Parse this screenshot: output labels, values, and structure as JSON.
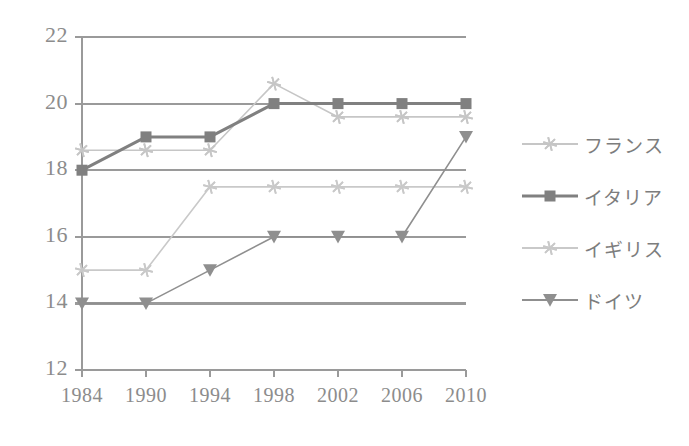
{
  "chart_data": {
    "type": "line",
    "title": "",
    "subtitle": "",
    "xlabel": "",
    "ylabel": "",
    "categories": [
      "1984",
      "1990",
      "1994",
      "1998",
      "2002",
      "2006",
      "2010"
    ],
    "x": [
      1984,
      1990,
      1994,
      1998,
      2002,
      2006,
      2010
    ],
    "ylim": [
      12,
      22
    ],
    "yticks": [
      12,
      14,
      16,
      18,
      20,
      22
    ],
    "grid": "horizontal",
    "legend_position": "right",
    "series": [
      {
        "name": "フランス",
        "color": "#c6c6c6",
        "marker": "star",
        "values": [
          18.6,
          18.6,
          18.6,
          20.6,
          19.6,
          19.6,
          19.6
        ]
      },
      {
        "name": "イタリア",
        "color": "#808080",
        "marker": "square",
        "values": [
          18,
          19,
          19,
          20,
          20,
          20,
          20
        ]
      },
      {
        "name": "イギリス",
        "color": "#c9c9c9",
        "marker": "star",
        "values": [
          15,
          15,
          17.5,
          17.5,
          17.5,
          17.5,
          17.5
        ]
      },
      {
        "name": "ドイツ",
        "color": "#8f8f8f",
        "marker": "triangle-down",
        "values": [
          14,
          14,
          15,
          16,
          16,
          16,
          19
        ]
      }
    ]
  },
  "axes": {
    "y_tick_labels": [
      "22",
      "20",
      "18",
      "16",
      "14",
      "12"
    ],
    "x_tick_labels": [
      "1984",
      "1990",
      "1994",
      "1998",
      "2002",
      "2006",
      "2010"
    ],
    "axis_color": "#9a9a9a",
    "grid_color": "#9a9a9a",
    "tick_label_color": "#8c8c8c"
  },
  "legend": {
    "entries": [
      {
        "label": "フランス",
        "color": "#c6c6c6",
        "marker": "star"
      },
      {
        "label": "イタリア",
        "color": "#808080",
        "marker": "square"
      },
      {
        "label": "イギリス",
        "color": "#c9c9c9",
        "marker": "star"
      },
      {
        "label": "ドイツ",
        "color": "#8f8f8f",
        "marker": "triangle-down"
      }
    ]
  },
  "plot_geometry": {
    "left": 82,
    "right": 466,
    "top": 37,
    "bottom": 370
  }
}
